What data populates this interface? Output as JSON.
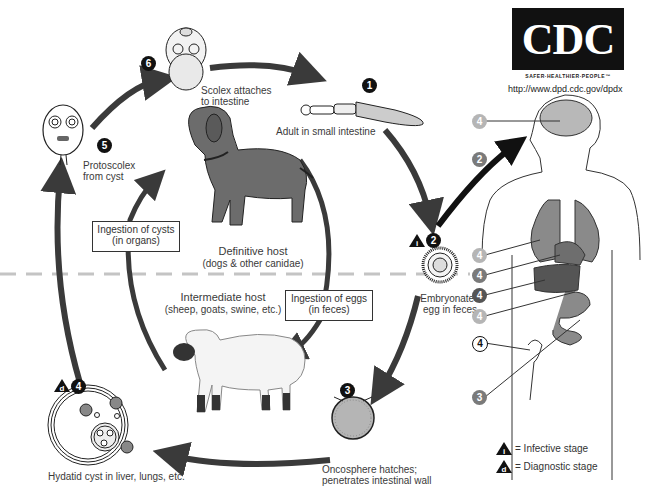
{
  "branding": {
    "logo": "CDC",
    "tagline": "SAFER·HEALTHIER·PEOPLE™",
    "url": "http://www.dpd.cdc.gov/dpdx"
  },
  "stages": [
    {
      "number": "1",
      "label_line1": "Adult in small intestine",
      "label_line2": ""
    },
    {
      "number": "2",
      "label_line1": "Embryonated",
      "label_line2": "egg in feces"
    },
    {
      "number": "3",
      "label_line1": "Oncosphere hatches;",
      "label_line2": "penetrates intestinal wall"
    },
    {
      "number": "4",
      "label_line1": "Hydatid cyst in liver, lungs, etc.",
      "label_line2": ""
    },
    {
      "number": "5",
      "label_line1": "Protoscolex",
      "label_line2": "from cyst"
    },
    {
      "number": "6",
      "label_line1": "Scolex attaches",
      "label_line2": "to intestine"
    }
  ],
  "hosts": {
    "definitive": {
      "title": "Definitive host",
      "subtitle": "(dogs & other canidae)"
    },
    "intermediate": {
      "title": "Intermediate host",
      "subtitle": "(sheep, goats, swine, etc.)"
    }
  },
  "boxes": {
    "cysts": {
      "line1": "Ingestion of cysts",
      "line2": "(in organs)"
    },
    "eggs": {
      "line1": "Ingestion of eggs",
      "line2": "(in feces)"
    }
  },
  "human_markers": [
    "4",
    "2",
    "4",
    "4",
    "4",
    "4",
    "4",
    "3"
  ],
  "legend": {
    "infective_symbol": "i",
    "infective_label": "= Infective stage",
    "diagnostic_symbol": "d",
    "diagnostic_label": "= Diagnostic stage"
  },
  "colors": {
    "arrow": "#3a3a3a",
    "divider": "#c0c0c0",
    "organ_light": "#b8b8b8",
    "organ_mid": "#7d7d7d",
    "organ_dark": "#585858"
  }
}
